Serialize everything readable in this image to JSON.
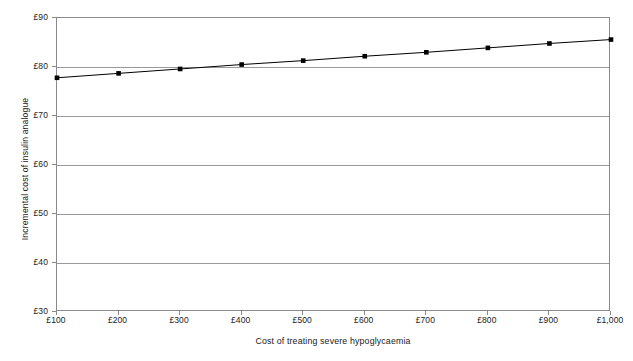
{
  "chart_data": {
    "type": "line",
    "title": "",
    "xlabel": "Cost of treating severe hypoglycaemia",
    "ylabel": "Incremental cost of insulin analogue",
    "x": [
      100,
      200,
      300,
      400,
      500,
      600,
      700,
      800,
      900,
      1000
    ],
    "x_tick_labels": [
      "£100",
      "£200",
      "£300",
      "£400",
      "£500",
      "£600",
      "£700",
      "£800",
      "£900",
      "£1,000"
    ],
    "values": [
      77.8,
      78.7,
      79.6,
      80.5,
      81.3,
      82.2,
      83.0,
      83.9,
      84.8,
      85.6
    ],
    "y_tick_labels": [
      "£90",
      "£80",
      "£70",
      "£60",
      "£50",
      "£40",
      "£30"
    ],
    "y_ticks": [
      90,
      80,
      70,
      60,
      50,
      40,
      30
    ],
    "ylim": [
      30,
      90
    ],
    "xlim": [
      100,
      1000
    ],
    "grid": "horizontal",
    "legend": "none",
    "marker": "square",
    "marker_color": "#000000",
    "line_color": "#000000",
    "gridline_color": "#9a9a9a",
    "axis_color": "#8a8a8a",
    "background": "#ffffff"
  }
}
